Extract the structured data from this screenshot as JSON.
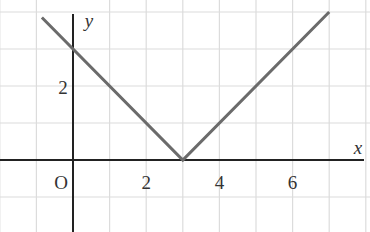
{
  "chart_data": {
    "type": "line",
    "title": "",
    "xlabel": "x",
    "ylabel": "y",
    "origin_label": "O",
    "x_ticks": [
      2,
      4,
      6
    ],
    "y_ticks": [
      2
    ],
    "xlim": [
      -2,
      8
    ],
    "ylim": [
      -2,
      4.3
    ],
    "grid": true,
    "function": "y = |x - 3|",
    "series": [
      {
        "name": "y = |x - 3|",
        "x": [
          -0.85,
          3,
          7
        ],
        "y": [
          3.85,
          0,
          4
        ]
      }
    ],
    "colors": {
      "line": "#6b6b6b",
      "axis": "#222222",
      "grid": "#dcdcdc"
    }
  }
}
